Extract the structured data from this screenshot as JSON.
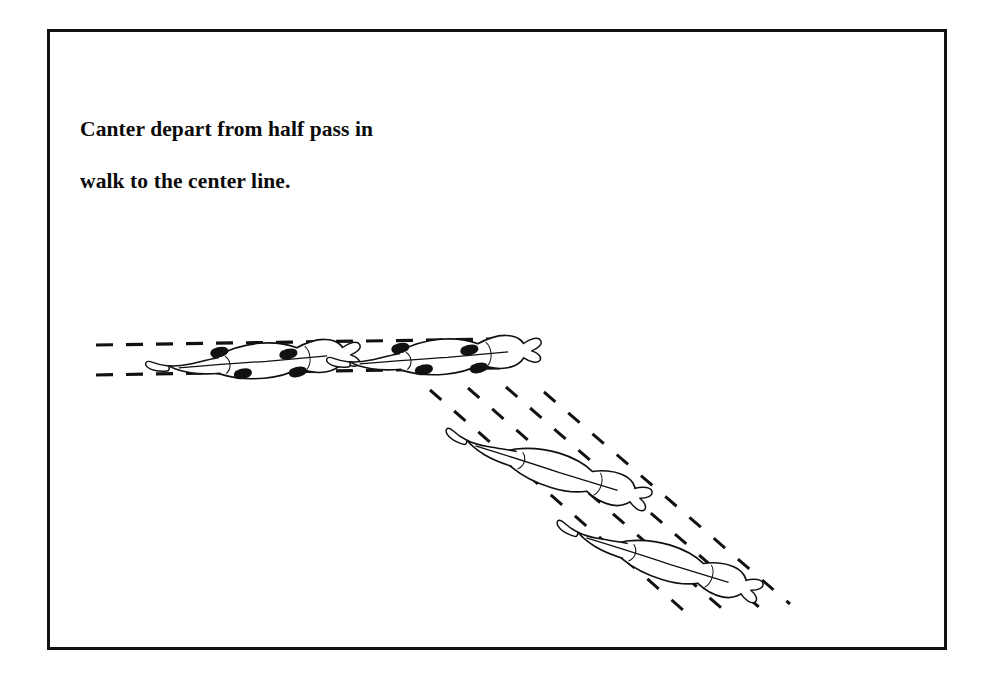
{
  "page": {
    "title": "Canter depart from half pass in walk to the center line.",
    "background_color": "#ffffff",
    "ink_color": "#111111"
  },
  "frame": {
    "border_color": "#111111",
    "border_width_px": 3,
    "x": 47,
    "y": 29,
    "width": 900,
    "height": 621
  },
  "caption": {
    "line1": "Canter depart from half pass in",
    "line2": "walk to the center line.",
    "full_text": "Canter depart from half pass in walk to the center line.",
    "color": "#0b0b0b",
    "x": 80,
    "y": 90
  },
  "diagram": {
    "type": "dressage-arena-movement",
    "view": "overhead",
    "track_style": "dashed",
    "dash_color": "#111111",
    "phases": [
      {
        "name": "half-pass-in-walk",
        "label": "half pass in walk",
        "direction": "left to right, slight upward drift",
        "lines": 2,
        "horse_count": 2,
        "hoof_marks": "visible black hoof prints"
      },
      {
        "name": "canter-depart-to-center-line",
        "label": "canter to the center line",
        "direction": "diagonal down and to the right",
        "lines": 4,
        "horse_count": 2,
        "hoof_marks": "none"
      }
    ],
    "horses": [
      {
        "id": "horse-1",
        "phase": "half-pass-in-walk",
        "cx": 247,
        "cy": 362,
        "angle_deg": -5,
        "scale": 1.0,
        "hooves": true
      },
      {
        "id": "horse-2",
        "phase": "half-pass-in-walk",
        "cx": 427,
        "cy": 358,
        "angle_deg": -5,
        "scale": 1.0,
        "hooves": true
      },
      {
        "id": "horse-3",
        "phase": "canter-depart-to-center-line",
        "cx": 540,
        "cy": 466,
        "angle_deg": 17,
        "scale": 1.0,
        "hooves": false
      },
      {
        "id": "horse-4",
        "phase": "canter-depart-to-center-line",
        "cx": 650,
        "cy": 558,
        "angle_deg": 17,
        "scale": 1.0,
        "hooves": false
      }
    ],
    "tracks": [
      {
        "id": "walk-track-upper",
        "type": "horizontal",
        "x1": 96,
        "y1": 345,
        "x2": 500,
        "y2": 340
      },
      {
        "id": "walk-track-lower",
        "type": "horizontal",
        "x1": 96,
        "y1": 374,
        "x2": 500,
        "y2": 368
      },
      {
        "id": "canter-track-1",
        "type": "diagonal",
        "x1": 432,
        "y1": 388,
        "x2": 690,
        "y2": 612
      },
      {
        "id": "canter-track-2",
        "type": "diagonal",
        "x1": 470,
        "y1": 386,
        "x2": 724,
        "y2": 608
      },
      {
        "id": "canter-track-3",
        "type": "diagonal",
        "x1": 505,
        "y1": 386,
        "x2": 757,
        "y2": 604
      },
      {
        "id": "canter-track-4",
        "type": "diagonal",
        "x1": 540,
        "y1": 390,
        "x2": 786,
        "y2": 600
      }
    ]
  }
}
